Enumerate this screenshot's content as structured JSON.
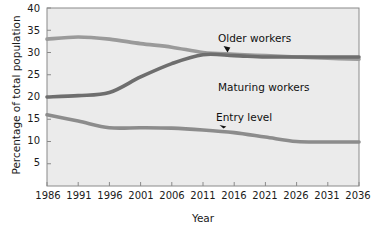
{
  "chart_data": {
    "type": "line",
    "title": "",
    "xlabel": "Year",
    "ylabel": "Percentage of total population",
    "xlim": [
      1986,
      2036
    ],
    "ylim": [
      0,
      40
    ],
    "grid": false,
    "legend_position": "inline-annotations",
    "x": [
      1986,
      1991,
      1996,
      2001,
      2006,
      2011,
      2016,
      2021,
      2026,
      2031,
      2036
    ],
    "xticklabels": [
      "1986",
      "1991",
      "1996",
      "2001",
      "2006",
      "2011",
      "2016",
      "2021",
      "2026",
      "2031",
      "2036"
    ],
    "yticklabels": [
      "0",
      "5",
      "10",
      "15",
      "20",
      "25",
      "30",
      "35",
      "40"
    ],
    "yticks": [
      0,
      5,
      10,
      15,
      20,
      25,
      30,
      35,
      40
    ],
    "series": [
      {
        "name": "Maturing workers",
        "color": "#9a9a9a",
        "values": [
          33.0,
          33.5,
          33.0,
          32.0,
          31.2,
          30.0,
          29.6,
          29.3,
          29.0,
          28.7,
          28.5
        ]
      },
      {
        "name": "Older workers",
        "color": "#6e6e6e",
        "values": [
          20.0,
          20.3,
          21.0,
          24.5,
          27.5,
          29.5,
          29.3,
          29.0,
          29.0,
          29.0,
          29.0
        ]
      },
      {
        "name": "Entry level",
        "color": "#8c8c8c",
        "values": [
          16.0,
          14.6,
          13.1,
          13.1,
          13.0,
          12.6,
          12.0,
          11.0,
          10.0,
          9.9,
          9.9
        ]
      }
    ],
    "annotations": [
      {
        "text": "Older workers",
        "series": "Older workers",
        "label_x": 218,
        "label_y": 32
      },
      {
        "text": "Maturing workers",
        "series": "Maturing workers",
        "label_x": 218,
        "label_y": 81
      },
      {
        "text": "Entry level",
        "series": "Entry level",
        "label_x": 216,
        "label_y": 111
      }
    ]
  },
  "axes": {
    "plot_background": "#ebebeb",
    "frame_color": "#8a8a8a",
    "text_color": "#1a1a1a"
  }
}
